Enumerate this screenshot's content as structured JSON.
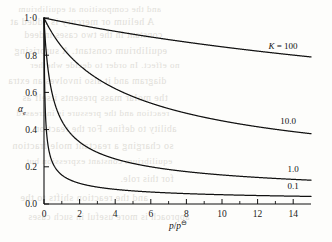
{
  "figure": {
    "name": "dissociation-vs-reduced-pressure",
    "background_color": "#fdfdfb",
    "line_color": "#111111"
  },
  "axes": {
    "x": {
      "label_main": "p",
      "label_slash": "/",
      "label_den": "p",
      "label_sup": "⊖",
      "ticks": [
        "0",
        "2",
        "4",
        "6",
        "8",
        "10",
        "12",
        "14"
      ],
      "tick_values": [
        0,
        2,
        4,
        6,
        8,
        10,
        12,
        14
      ],
      "minor_ticks": [
        1,
        3,
        5,
        7,
        9,
        11,
        13
      ],
      "range": [
        0,
        15
      ]
    },
    "y": {
      "label_main": "α",
      "label_sub": "e",
      "ticks": [
        "1·0",
        "0.8",
        "0.6",
        "0.4",
        "0.2",
        "0.0"
      ],
      "tick_values": [
        1.0,
        0.8,
        0.6,
        0.4,
        0.2,
        0.0
      ],
      "range": [
        0,
        1
      ]
    }
  },
  "curve_labels": [
    {
      "text": "K = 100",
      "k_italic": "K",
      "rest": " = 100"
    },
    {
      "text": "10.0"
    },
    {
      "text": "1.0"
    },
    {
      "text": "0.1"
    }
  ],
  "bleed_text": [
    "and the composition at equilibrium",
    "A helium or mercury is added at",
    "constant in the two cases indeed",
    "equilibrium constant. A surprising",
    "no effect. In order to decide whether",
    "diagram and it also involves an extra",
    "the molar mass presents itself as",
    "reaction and the pressure is increased",
    "ability to define. For the reaction",
    "so charging a reactant mole fraction",
    "equilibrium constant expression but",
    "for this role.",
    "and the reaction shifts to the",
    "approach is more useful in such cases"
  ],
  "chart_data": {
    "type": "line",
    "title": "",
    "xlabel": "p/p⊖",
    "ylabel": "αe",
    "xlim": [
      0,
      15
    ],
    "ylim": [
      0,
      1
    ],
    "grid": false,
    "legend": "inline-right-of-curve",
    "formula": "alpha = 1/sqrt(1 + 4*(p/p0)/K)",
    "x": [
      0,
      0.25,
      0.5,
      0.75,
      1,
      1.5,
      2,
      2.5,
      3,
      4,
      5,
      6,
      7,
      8,
      9,
      10,
      11,
      12,
      13,
      14,
      15
    ],
    "series": [
      {
        "name": "K = 100",
        "K": 100,
        "values": [
          1.0,
          0.995,
          0.99,
          0.985,
          0.98,
          0.971,
          0.962,
          0.953,
          0.945,
          0.928,
          0.913,
          0.898,
          0.884,
          0.87,
          0.858,
          0.845,
          0.834,
          0.823,
          0.812,
          0.802,
          0.792
        ]
      },
      {
        "name": "10.0",
        "K": 10,
        "values": [
          1.0,
          0.953,
          0.913,
          0.877,
          0.845,
          0.79,
          0.745,
          0.707,
          0.674,
          0.62,
          0.577,
          0.542,
          0.513,
          0.487,
          0.465,
          0.447,
          0.43,
          0.415,
          0.401,
          0.389,
          0.378
        ]
      },
      {
        "name": "1.0",
        "K": 1,
        "values": [
          1.0,
          0.707,
          0.577,
          0.5,
          0.447,
          0.378,
          0.333,
          0.302,
          0.277,
          0.243,
          0.218,
          0.2,
          0.186,
          0.174,
          0.164,
          0.156,
          0.149,
          0.143,
          0.137,
          0.133,
          0.129
        ]
      },
      {
        "name": "0.1",
        "K": 0.1,
        "values": [
          1.0,
          0.302,
          0.218,
          0.18,
          0.157,
          0.128,
          0.111,
          0.1,
          0.091,
          0.079,
          0.0705,
          0.0645,
          0.0597,
          0.0559,
          0.0527,
          0.05,
          0.0477,
          0.0456,
          0.0439,
          0.0423,
          0.0408
        ]
      }
    ]
  }
}
